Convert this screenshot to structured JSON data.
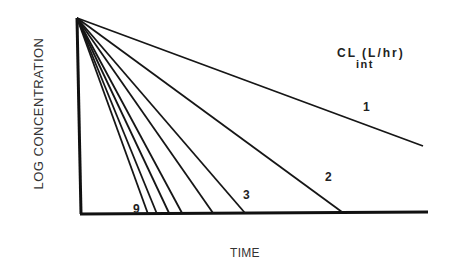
{
  "chart_data": {
    "type": "line",
    "title": "",
    "xlabel": "TIME",
    "ylabel": "LOG CONCENTRATION",
    "legend_title": "CL (L/hr)",
    "legend_subscript": "int",
    "grid": false,
    "x_ticks": [],
    "y_ticks": [],
    "origin_px": {
      "x": 77,
      "y": 18
    },
    "baseline_px": 214,
    "series": [
      {
        "name": "1",
        "label": "1",
        "end_px": {
          "x": 423,
          "y": 146
        }
      },
      {
        "name": "2",
        "label": "2",
        "end_px": {
          "x": 342,
          "y": 212
        }
      },
      {
        "name": "3",
        "label": "3",
        "end_px": {
          "x": 245,
          "y": 213
        }
      },
      {
        "name": "4",
        "label": "",
        "end_px": {
          "x": 213,
          "y": 213
        }
      },
      {
        "name": "5",
        "label": "",
        "end_px": {
          "x": 182,
          "y": 213
        }
      },
      {
        "name": "6",
        "label": "",
        "end_px": {
          "x": 169,
          "y": 213
        }
      },
      {
        "name": "7",
        "label": "",
        "end_px": {
          "x": 157,
          "y": 214
        }
      },
      {
        "name": "9",
        "label": "9",
        "end_px": {
          "x": 148,
          "y": 214
        }
      }
    ],
    "annotations": [
      {
        "text": "1",
        "x": 363,
        "y": 108
      },
      {
        "text": "2",
        "x": 325,
        "y": 176
      },
      {
        "text": "3",
        "x": 242,
        "y": 187
      },
      {
        "text": "9",
        "x": 132,
        "y": 199
      }
    ]
  }
}
